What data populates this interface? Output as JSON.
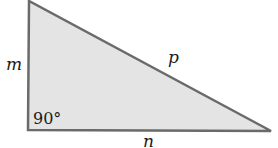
{
  "diagram": {
    "type": "right-triangle",
    "fill_color": "#e4e4e4",
    "stroke_color": "#6a6a6a",
    "vertices": {
      "top": [
        29,
        1
      ],
      "right_angle": [
        28,
        130
      ],
      "right": [
        271,
        131
      ]
    },
    "labels": {
      "vertical_side": "m",
      "hypotenuse": "p",
      "horizontal_side": "n",
      "right_angle": "90°"
    }
  }
}
